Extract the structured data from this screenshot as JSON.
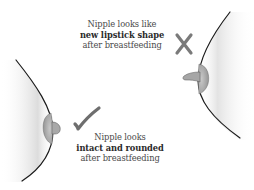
{
  "diagram": {
    "incorrect": {
      "line1": "Nipple looks  like",
      "line2": "new lipstick shape",
      "line3": "after breastfeeding",
      "mark_icon": "cross-mark",
      "mark_color": "#7a7a7a"
    },
    "correct": {
      "line1": "Nipple looks",
      "line2": "intact and rounded",
      "line3": "after breastfeeding",
      "mark_icon": "check-mark",
      "mark_color": "#6e6e6e"
    },
    "colors": {
      "outline": "#1a1a1a",
      "areola": "#b5b5b5",
      "nipple": "#a0a0a0",
      "shade": "#d8d8d8"
    }
  }
}
